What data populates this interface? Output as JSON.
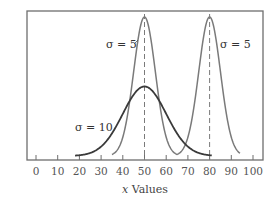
{
  "chart_data": {
    "type": "line",
    "title": "",
    "xlabel": "x Values",
    "xlabel_italic_part": "x",
    "xlabel_rest": " Values",
    "ylabel": "",
    "xlim": [
      0,
      100
    ],
    "x_ticks": [
      0,
      10,
      20,
      30,
      40,
      50,
      60,
      70,
      80,
      90,
      100
    ],
    "grid": false,
    "legend": null,
    "series": [
      {
        "name": "σ = 5 (μ = 50)",
        "mean": 50,
        "sd": 5,
        "x_range": [
          35,
          65
        ],
        "color": "#7a7a7a",
        "peak_rel": 1.0
      },
      {
        "name": "σ = 5 (μ = 80)",
        "mean": 80,
        "sd": 5,
        "x_range": [
          65,
          94
        ],
        "color": "#7a7a7a",
        "peak_rel": 1.0
      },
      {
        "name": "σ = 10 (μ = 50)",
        "mean": 50,
        "sd": 10,
        "x_range": [
          18,
          81
        ],
        "color": "#3a3a3a",
        "peak_rel": 0.5
      }
    ],
    "reference_lines": [
      {
        "x": 50,
        "style": "dashed"
      },
      {
        "x": 80,
        "style": "dashed"
      }
    ],
    "annotations": [
      {
        "text": "σ = 5",
        "near_x": 43,
        "target": "left narrow curve"
      },
      {
        "text": "σ = 5",
        "near_x": 88,
        "target": "right narrow curve"
      },
      {
        "text": "σ = 10",
        "near_x": 21,
        "target": "broad curve"
      }
    ]
  },
  "labels": {
    "anno_left_sigma5": "σ = 5",
    "anno_right_sigma5": "σ = 5",
    "anno_sigma10": "σ = 10",
    "x_italic": "x",
    "x_rest": " Values"
  }
}
